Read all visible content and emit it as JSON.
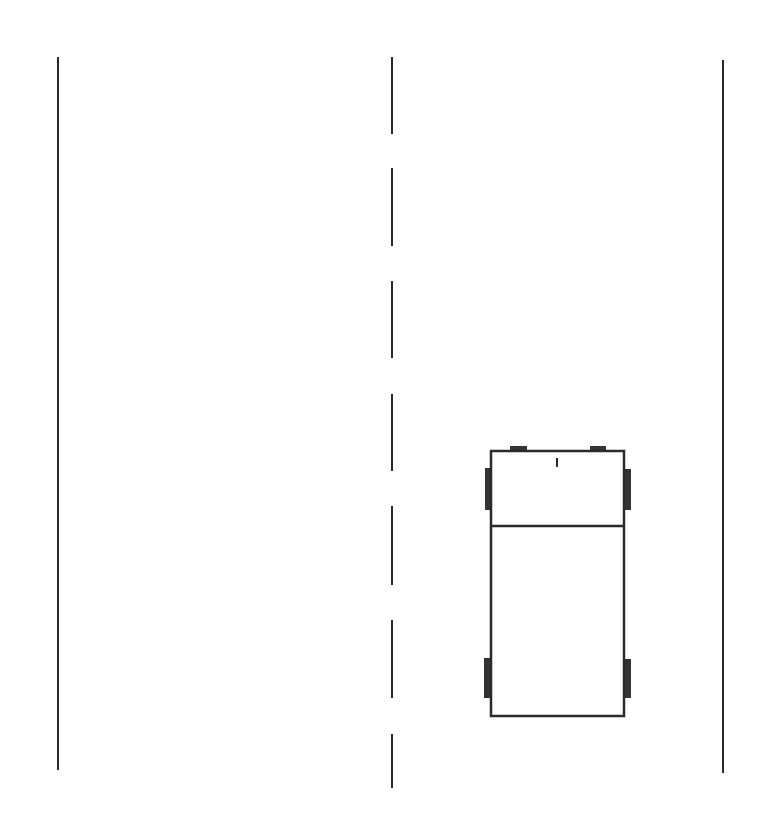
{
  "diagram": {
    "colors": {
      "background": "#ffffff",
      "line": "#2a2a2a",
      "wheel": "#333333",
      "car_fill": "#ffffff"
    },
    "road": {
      "left_edge": {
        "x": 58,
        "y1": 57,
        "y2": 770
      },
      "right_edge": {
        "x": 723,
        "y1": 60,
        "y2": 773
      },
      "center_line": {
        "x": 392,
        "style": "dashed",
        "dashes": [
          {
            "y1": 57,
            "y2": 134
          },
          {
            "y1": 168,
            "y2": 246
          },
          {
            "y1": 281,
            "y2": 358
          },
          {
            "y1": 394,
            "y2": 471
          },
          {
            "y1": 506,
            "y2": 585
          },
          {
            "y1": 620,
            "y2": 698
          },
          {
            "y1": 734,
            "y2": 788
          }
        ]
      }
    },
    "car": {
      "lane": "right",
      "body": {
        "x": 491,
        "y": 451,
        "width": 133,
        "height": 265
      },
      "divider_y": 526,
      "front_mark": {
        "x": 557,
        "y1": 458,
        "y2": 467
      },
      "mirrors": [
        {
          "x": 510,
          "y": 446,
          "width": 17,
          "height": 5
        },
        {
          "x": 590,
          "y": 446,
          "width": 16,
          "height": 5
        }
      ],
      "wheels": [
        {
          "name": "front-left",
          "x": 485,
          "y": 468,
          "width": 7,
          "height": 42
        },
        {
          "name": "front-right",
          "x": 623,
          "y": 469,
          "width": 8,
          "height": 41
        },
        {
          "name": "rear-left",
          "x": 484,
          "y": 658,
          "width": 8,
          "height": 40
        },
        {
          "name": "rear-right",
          "x": 623,
          "y": 659,
          "width": 8,
          "height": 39
        }
      ]
    }
  }
}
